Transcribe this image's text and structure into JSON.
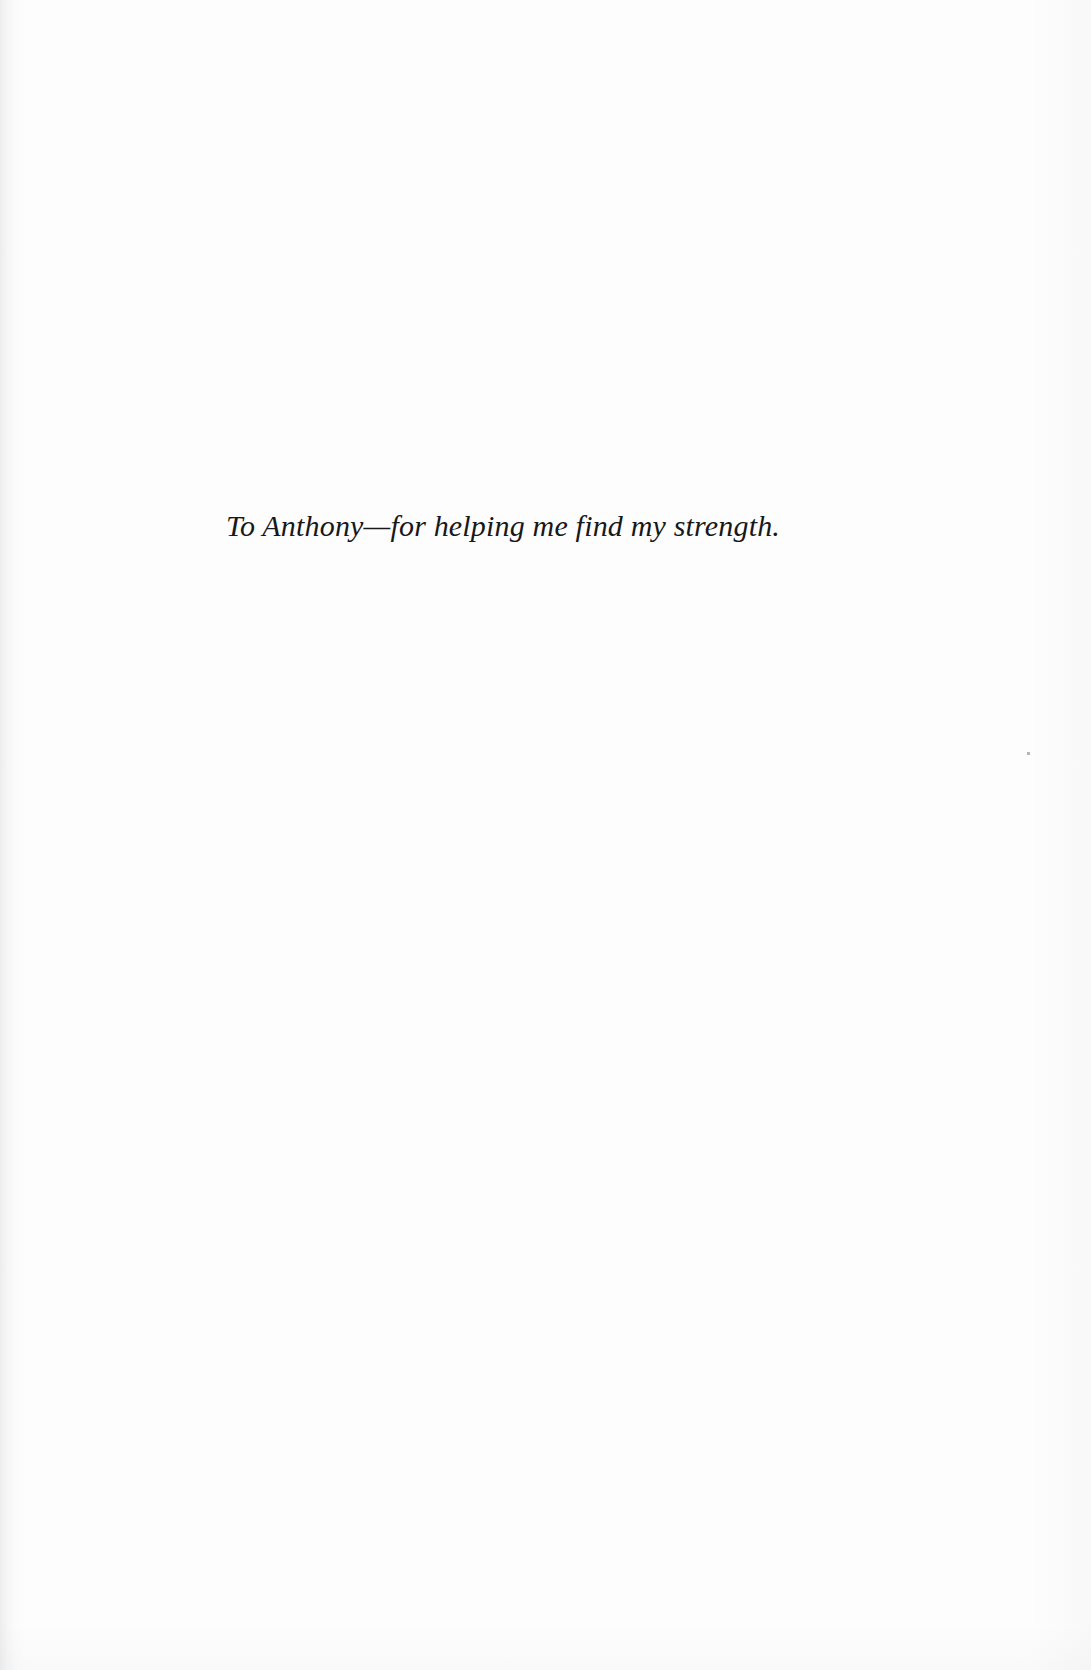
{
  "page": {
    "kind": "book-dedication-page",
    "background_color": "#fdfdfd",
    "text_color": "#17181a"
  },
  "dedication": {
    "text": "To Anthony—for helping me find my strength."
  }
}
